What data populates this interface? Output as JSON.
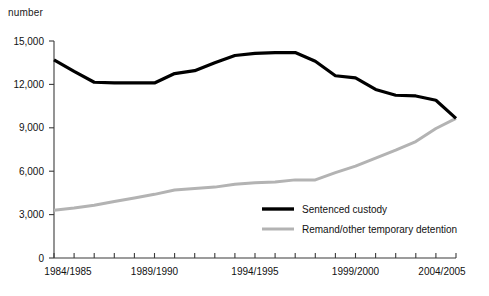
{
  "axis_unit_label": "number",
  "legend": {
    "position": "inside-bottom-right",
    "items": [
      {
        "label": "Sentenced custody",
        "color": "#000000"
      },
      {
        "label": "Remand/other temporary detention",
        "color": "#b3b3b3"
      }
    ]
  },
  "y_axis": {
    "ticks": [
      0,
      3000,
      6000,
      9000,
      12000,
      15000
    ],
    "tick_labels": [
      "0",
      "3,000",
      "6,000",
      "9,000",
      "12,000",
      "15,000"
    ],
    "min": 0,
    "max": 15000
  },
  "x_axis": {
    "tick_labels_shown": [
      "1984/1985",
      "1989/1990",
      "1994/1995",
      "1999/2000",
      "2004/2005"
    ]
  },
  "chart_data": {
    "type": "line",
    "title": "",
    "subtitle": "",
    "xlabel": "",
    "ylabel": "number",
    "ylim": [
      0,
      15000
    ],
    "grid": false,
    "legend_position": "inside-bottom-right",
    "categories": [
      "1984/1985",
      "1985/1986",
      "1986/1987",
      "1987/1988",
      "1988/1989",
      "1989/1990",
      "1990/1991",
      "1991/1992",
      "1992/1993",
      "1993/1994",
      "1994/1995",
      "1995/1996",
      "1996/1997",
      "1997/1998",
      "1998/1999",
      "1999/2000",
      "2000/2001",
      "2001/2002",
      "2002/2003",
      "2003/2004",
      "2004/2005"
    ],
    "series": [
      {
        "name": "Sentenced custody",
        "color": "#000000",
        "values": [
          13700,
          12900,
          12150,
          12100,
          12100,
          12100,
          12750,
          12950,
          13500,
          14000,
          14150,
          14200,
          14200,
          13600,
          12600,
          12450,
          11650,
          11250,
          11200,
          10900,
          9650
        ]
      },
      {
        "name": "Remand/other temporary detention",
        "color": "#b3b3b3",
        "values": [
          3300,
          3450,
          3650,
          3900,
          4150,
          4400,
          4700,
          4800,
          4900,
          5100,
          5200,
          5250,
          5400,
          5400,
          5900,
          6350,
          6900,
          7450,
          8050,
          8950,
          9650
        ]
      }
    ]
  }
}
